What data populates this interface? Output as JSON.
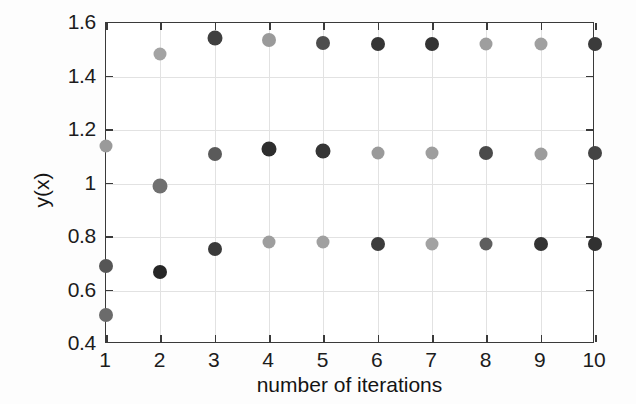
{
  "chart_data": {
    "type": "scatter",
    "title": "",
    "xlabel": "number of iterations",
    "ylabel": "y(x)",
    "xlim": [
      1,
      10
    ],
    "ylim": [
      0.4,
      1.6
    ],
    "xticks": [
      "1",
      "2",
      "3",
      "4",
      "5",
      "6",
      "7",
      "8",
      "9",
      "10"
    ],
    "yticks": [
      "0.4",
      "0.6",
      "0.8",
      "1",
      "1.2",
      "1.4",
      "1.6"
    ],
    "xtick_values": [
      1,
      2,
      3,
      4,
      5,
      6,
      7,
      8,
      9,
      10
    ],
    "ytick_values": [
      0.4,
      0.6,
      0.8,
      1,
      1.2,
      1.4,
      1.6
    ],
    "grid": true,
    "legend": "none",
    "marker": "filled-circle",
    "x": [
      1,
      2,
      3,
      4,
      5,
      6,
      7,
      8,
      9,
      10
    ],
    "series": [
      {
        "name": "upper branch",
        "values": [
          1.14,
          1.485,
          1.545,
          1.535,
          1.525,
          1.52,
          1.52,
          1.52,
          1.52,
          1.52
        ],
        "colors": [
          "#9a9a9a",
          "#a3a3a3",
          "#404040",
          "#9a9a9a",
          "#4d4d4d",
          "#353535",
          "#333333",
          "#9e9e9e",
          "#a0a0a0",
          "#3b3b3b"
        ],
        "sizes": [
          13,
          13,
          15,
          14,
          14,
          14,
          14,
          13,
          13,
          14
        ]
      },
      {
        "name": "middle branch",
        "values": [
          0.69,
          0.99,
          1.11,
          1.13,
          1.12,
          1.115,
          1.115,
          1.115,
          1.11,
          1.115
        ],
        "colors": [
          "#565656",
          "#707070",
          "#5a5a5a",
          "#2e2e2e",
          "#353535",
          "#9a9a9a",
          "#9e9e9e",
          "#4a4a4a",
          "#9c9c9c",
          "#444444"
        ],
        "sizes": [
          14,
          15,
          14,
          15,
          15,
          13,
          13,
          14,
          13,
          14
        ]
      },
      {
        "name": "lower branch",
        "values": [
          0.51,
          0.67,
          0.755,
          0.78,
          0.78,
          0.775,
          0.775,
          0.775,
          0.775,
          0.775
        ],
        "colors": [
          "#6b6b6b",
          "#262626",
          "#3a3a3a",
          "#9e9e9e",
          "#a0a0a0",
          "#3c3c3c",
          "#a2a2a2",
          "#5e5e5e",
          "#333333",
          "#313131"
        ],
        "sizes": [
          14,
          14,
          14,
          13,
          13,
          14,
          13,
          13,
          14,
          14
        ]
      }
    ]
  },
  "colors": {
    "axis": "#3a3a3a",
    "grid": "#e2e2e2",
    "text": "#1c1c1c",
    "background": "#ffffff",
    "dark_marker": "#333333",
    "light_marker": "#9e9e9e"
  }
}
